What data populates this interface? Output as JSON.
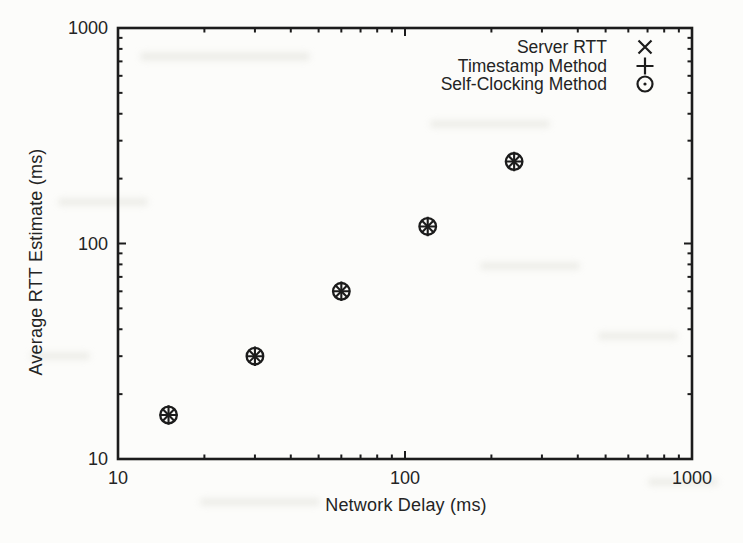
{
  "figure": {
    "kind": "scanned-paper-figure"
  },
  "chart_data": {
    "type": "scatter",
    "title": "",
    "xlabel": "Network Delay (ms)",
    "ylabel": "Average RTT Estimate (ms)",
    "x_scale": "log",
    "y_scale": "log",
    "xlim": [
      10,
      1000
    ],
    "ylim": [
      10,
      1000
    ],
    "x_ticks": [
      10,
      100,
      1000
    ],
    "y_ticks": [
      10,
      100,
      1000
    ],
    "grid": false,
    "legend_position": "top-right",
    "x": [
      15,
      30,
      60,
      120,
      240
    ],
    "series": [
      {
        "name": "Server RTT",
        "marker": "x-marker-icon",
        "values": [
          16,
          30,
          60,
          120,
          240
        ]
      },
      {
        "name": "Timestamp Method",
        "marker": "plus-marker-icon",
        "values": [
          16,
          30,
          60,
          120,
          240
        ]
      },
      {
        "name": "Self-Clocking Method",
        "marker": "circle-dot-marker-icon",
        "values": [
          16,
          30,
          60,
          120,
          240
        ]
      }
    ],
    "ink_color": "#1c1c1c",
    "text_color": "#242424"
  }
}
